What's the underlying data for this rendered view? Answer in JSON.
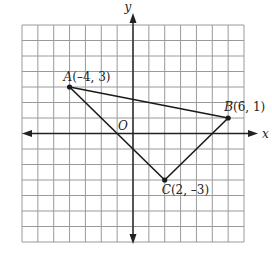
{
  "diagram": {
    "type": "coordinate-plane-triangle",
    "grid": {
      "xmin": -7,
      "xmax": 7,
      "ymin": -7,
      "ymax": 7,
      "step": 1
    },
    "axes": {
      "x_label": "x",
      "y_label": "y",
      "origin_label": "O"
    },
    "points": [
      {
        "name": "A",
        "x": -4,
        "y": 3,
        "label": "A(–4, 3)"
      },
      {
        "name": "B",
        "x": 6,
        "y": 1,
        "label": "B(6, 1)"
      },
      {
        "name": "C",
        "x": 2,
        "y": -3,
        "label": "C(2, –3)"
      }
    ],
    "segments": [
      [
        "A",
        "B"
      ],
      [
        "B",
        "C"
      ],
      [
        "C",
        "A"
      ]
    ],
    "colors": {
      "grid": "#9a9a9a",
      "axis": "#222222",
      "triangle": "#1a1a1a",
      "text": "#222222"
    }
  }
}
